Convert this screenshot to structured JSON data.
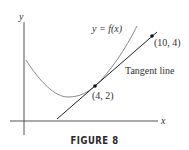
{
  "figure": {
    "caption": "FIGURE 8",
    "labels": {
      "x_axis": "x",
      "y_axis": "y",
      "curve": "y = f(x)",
      "tangent": "Tangent line",
      "point_tangency": "(4, 2)",
      "point_second": "(10, 4)"
    },
    "colors": {
      "curve": "#8a8a8a",
      "line": "#222222",
      "axes": "#555555",
      "text": "#333333"
    }
  },
  "diagram": {
    "type": "function-graph-with-tangent",
    "points": [
      {
        "label": "(4, 2)",
        "x": 4,
        "y": 2,
        "role": "point of tangency"
      },
      {
        "label": "(10, 4)",
        "x": 10,
        "y": 4,
        "role": "second point on tangent line"
      }
    ],
    "tangent_slope": "1/3"
  }
}
